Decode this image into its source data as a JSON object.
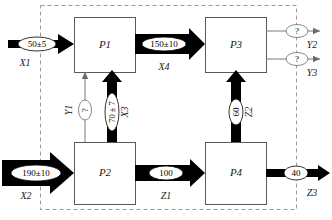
{
  "diagram": {
    "boundary": {
      "name": "system-boundary",
      "style": "dashed"
    },
    "processes": [
      {
        "id": "P1",
        "label": "P1"
      },
      {
        "id": "P2",
        "label": "P2"
      },
      {
        "id": "P3",
        "label": "P3"
      },
      {
        "id": "P4",
        "label": "P4"
      }
    ],
    "flows": [
      {
        "id": "X1",
        "name": "X1",
        "value": "50±5",
        "kind": "thick",
        "known": true
      },
      {
        "id": "X2",
        "name": "X2",
        "value": "190±10",
        "kind": "thick",
        "known": true
      },
      {
        "id": "X3",
        "name": "X3",
        "value": "70 ± 7",
        "kind": "thick",
        "known": true
      },
      {
        "id": "X4",
        "name": "X4",
        "value": "150±10",
        "kind": "thick",
        "known": true
      },
      {
        "id": "Y1",
        "name": "Y1",
        "value": "?",
        "kind": "thin",
        "known": false
      },
      {
        "id": "Y2",
        "name": "Y2",
        "value": "?",
        "kind": "thin",
        "known": false
      },
      {
        "id": "Y3",
        "name": "Y3",
        "value": "?",
        "kind": "thin",
        "known": false
      },
      {
        "id": "Z1",
        "name": "Z1",
        "value": "100",
        "kind": "thick",
        "known": true
      },
      {
        "id": "Z2",
        "name": "Z2",
        "value": "60",
        "kind": "thick",
        "known": true
      },
      {
        "id": "Z3",
        "name": "Z3",
        "value": "40",
        "kind": "thick",
        "known": true
      }
    ],
    "colors": {
      "flow_fill": "#000000",
      "box_stroke": "#5a5a5a",
      "boundary_stroke": "#9a9a9a",
      "background": "#ffffff"
    }
  }
}
